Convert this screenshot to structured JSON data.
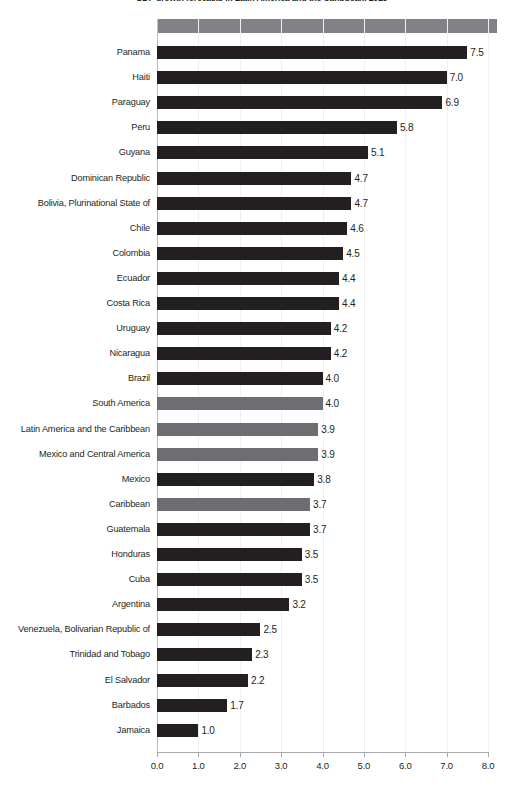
{
  "chart_data": {
    "type": "bar",
    "orientation": "horizontal",
    "title": "GDP growth forecasts in Latin America and the Caribbean, 2013",
    "xlabel": "",
    "ylabel": "",
    "xlim": [
      0.0,
      8.0
    ],
    "xticks": [
      "0.0",
      "1.0",
      "2.0",
      "3.0",
      "4.0",
      "5.0",
      "6.0",
      "7.0",
      "8.0"
    ],
    "xtick_values": [
      0,
      1,
      2,
      3,
      4,
      5,
      6,
      7,
      8
    ],
    "grid": false,
    "legend": "none",
    "value_format": "one-decimal",
    "series_colors": {
      "country": "#231f20",
      "region": "#6d6e71",
      "header_band": "#808285"
    },
    "categories": [
      "Panama",
      "Haiti",
      "Paraguay",
      "Peru",
      "Guyana",
      "Dominican Republic",
      "Bolivia, Plurinational State of",
      "Chile",
      "Colombia",
      "Ecuador",
      "Costa Rica",
      "Uruguay",
      "Nicaragua",
      "Brazil",
      "South America",
      "Latin America and the Caribbean",
      "Mexico and Central America",
      "Mexico",
      "Caribbean",
      "Guatemala",
      "Honduras",
      "Cuba",
      "Argentina",
      "Venezuela, Bolivarian Republic of",
      "Trinidad and Tobago",
      "El Salvador",
      "Barbados",
      "Jamaica"
    ],
    "values": [
      7.5,
      7.0,
      6.9,
      5.8,
      5.1,
      4.7,
      4.7,
      4.6,
      4.5,
      4.4,
      4.4,
      4.2,
      4.2,
      4.0,
      4.0,
      3.9,
      3.9,
      3.8,
      3.7,
      3.7,
      3.5,
      3.5,
      3.2,
      2.5,
      2.3,
      2.2,
      1.7,
      1.0
    ],
    "value_labels": [
      "7.5",
      "7.0",
      "6.9",
      "5.8",
      "5.1",
      "4.7",
      "4.7",
      "4.6",
      "4.5",
      "4.4",
      "4.4",
      "4.2",
      "4.2",
      "4.0",
      "4.0",
      "3.9",
      "3.9",
      "3.8",
      "3.7",
      "3.7",
      "3.5",
      "3.5",
      "3.2",
      "2.5",
      "2.3",
      "2.2",
      "1.7",
      "1.0"
    ],
    "kinds": [
      "country",
      "country",
      "country",
      "country",
      "country",
      "country",
      "country",
      "country",
      "country",
      "country",
      "country",
      "country",
      "country",
      "country",
      "region",
      "region",
      "region",
      "country",
      "region",
      "country",
      "country",
      "country",
      "country",
      "country",
      "country",
      "country",
      "country",
      "country"
    ]
  }
}
